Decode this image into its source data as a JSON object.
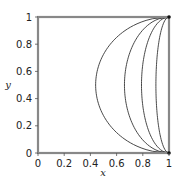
{
  "chart_data": {
    "type": "line",
    "title": "",
    "xlabel": "x",
    "ylabel": "y",
    "xlim": [
      0,
      1
    ],
    "ylim": [
      0,
      1
    ],
    "grid": false,
    "legend": null,
    "x_ticks": [
      "0",
      "0.2",
      "0.4",
      "0.6",
      "0.8",
      "1"
    ],
    "y_ticks": [
      "0",
      "0.2",
      "0.4",
      "0.6",
      "0.8",
      "1"
    ],
    "series": [
      {
        "name": "curve-1",
        "a": 0.56,
        "x_at_y_0_5": 0.44
      },
      {
        "name": "curve-2",
        "a": 0.34,
        "x_at_y_0_5": 0.66
      },
      {
        "name": "curve-3",
        "a": 0.21,
        "x_at_y_0_5": 0.79
      },
      {
        "name": "curve-4",
        "a": 0.1,
        "x_at_y_0_5": 0.9
      },
      {
        "name": "curve-5",
        "a": 0.0,
        "x_at_y_0_5": 1.0
      }
    ],
    "markers": [
      {
        "x": 1,
        "y": 0
      },
      {
        "x": 1,
        "y": 1
      }
    ],
    "line_color": "#333333",
    "frame_color": "#888888"
  }
}
